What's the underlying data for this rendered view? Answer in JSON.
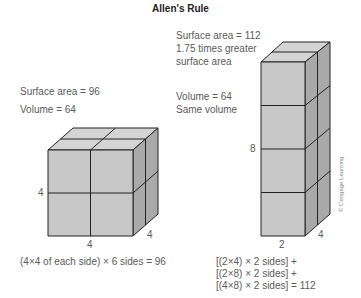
{
  "title": "Allen's Rule",
  "cube": {
    "surface_area": "Surface area = 96",
    "volume": "Volume = 64",
    "height_label": "4",
    "width_label": "4",
    "depth_label": "4",
    "formula": "(4×4 of each side) × 6 sides = 96"
  },
  "prism": {
    "surface_area": "Surface area = 112",
    "comparison_line1": "1.75 times greater",
    "comparison_line2": "surface area",
    "volume": "Volume = 64",
    "volume_note": "Same volume",
    "height_label": "8",
    "width_label": "2",
    "depth_label": "4",
    "formula_line1": "[(2×4) × 2 sides] +",
    "formula_line2": "[(2×8) × 2 sides] +",
    "formula_line3": "[(4×8) × 2 sides] = 112"
  },
  "credit": "© Cengage Learning",
  "colors": {
    "front_face": "#c8c8c8",
    "top_face": "#d4d4d4",
    "side_face": "#a9a9a9",
    "edge": "#222222"
  }
}
